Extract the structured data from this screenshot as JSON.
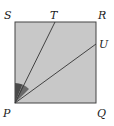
{
  "diagram": {
    "type": "geometry",
    "shape": "square",
    "vertices": {
      "P": "bottom-left",
      "Q": "bottom-right",
      "R": "top-right",
      "S": "top-left"
    },
    "points_on_sides": {
      "T": "on side SR",
      "U": "on side RQ"
    },
    "segments": [
      "PT",
      "PU"
    ],
    "shaded_angles": [
      "angle SPT",
      "angle TPU"
    ],
    "labels": {
      "P": "P",
      "Q": "Q",
      "R": "R",
      "S": "S",
      "T": "T",
      "U": "U"
    },
    "colors": {
      "square_fill": "#c8c8c8",
      "square_stroke": "#444444",
      "angle_dark": "#4a4a4a",
      "angle_mid": "#6a6a6a",
      "line": "#333333",
      "label": "#222222"
    }
  }
}
